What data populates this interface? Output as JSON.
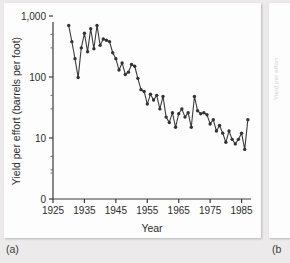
{
  "figure": {
    "panel_a_caption": "(a)",
    "panel_b_caption": "(b",
    "panel_b_axis_text": "Yield per effort"
  },
  "chart_data": {
    "type": "line",
    "title": "",
    "xlabel": "Year",
    "ylabel": "Yield per effort (barrels per foot)",
    "yscale": "log",
    "ylim": [
      3,
      1000
    ],
    "xlim": [
      1925,
      1988
    ],
    "grid": false,
    "legend": null,
    "marker": "filled-circle",
    "line_color": "#3c3c3c",
    "y_tick_labels": [
      "1,000",
      "100",
      "10",
      "0"
    ],
    "y_tick_values": [
      1000,
      100,
      10,
      0
    ],
    "y_minor_ticks": [
      500,
      300,
      50,
      30,
      5,
      3
    ],
    "x_tick_labels": [
      "1925",
      "1935",
      "1945",
      "1955",
      "1965",
      "1975",
      "1985"
    ],
    "x_tick_values": [
      1925,
      1935,
      1945,
      1955,
      1965,
      1975,
      1985
    ],
    "x": [
      1930,
      1931,
      1932,
      1933,
      1934,
      1935,
      1936,
      1937,
      1938,
      1939,
      1940,
      1941,
      1942,
      1943,
      1944,
      1945,
      1946,
      1947,
      1948,
      1949,
      1950,
      1951,
      1952,
      1953,
      1954,
      1955,
      1956,
      1957,
      1958,
      1959,
      1960,
      1961,
      1962,
      1963,
      1964,
      1965,
      1966,
      1967,
      1968,
      1969,
      1970,
      1971,
      1972,
      1973,
      1974,
      1975,
      1976,
      1977,
      1978,
      1979,
      1980,
      1981,
      1982,
      1983,
      1984,
      1985,
      1986,
      1987
    ],
    "values": [
      700,
      380,
      200,
      98,
      300,
      520,
      260,
      620,
      290,
      700,
      330,
      420,
      400,
      380,
      250,
      200,
      130,
      170,
      110,
      120,
      160,
      150,
      95,
      62,
      58,
      36,
      52,
      42,
      50,
      30,
      48,
      22,
      18,
      26,
      15,
      25,
      30,
      22,
      26,
      15,
      48,
      28,
      25,
      26,
      24,
      17,
      20,
      13,
      16,
      12,
      8.5,
      13,
      9.5,
      8,
      9.5,
      12,
      6.5,
      20
    ],
    "annotation": "Oil yield per foot drilled declines about two orders of magnitude over six decades."
  }
}
